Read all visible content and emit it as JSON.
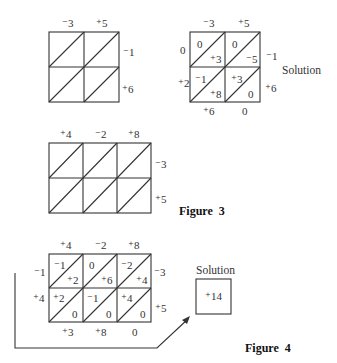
{
  "figure_top_left": {
    "columns": [
      "⁻3",
      "⁺5"
    ],
    "rows": [
      "⁻1",
      "⁺6"
    ]
  },
  "figure_top_right": {
    "columns": [
      "⁻3",
      "⁺5"
    ],
    "rows": [
      "⁻1",
      "⁺6"
    ],
    "cells": [
      [
        {
          "upper": "0",
          "lower": "⁺3"
        },
        {
          "upper": "0",
          "lower": "⁻5"
        }
      ],
      [
        {
          "upper": "⁻1",
          "lower": "⁺8"
        },
        {
          "upper": "⁺3",
          "lower": "0"
        }
      ]
    ],
    "left_sums": [
      "0",
      "⁺2"
    ],
    "bottom_sums": [
      "⁺6",
      "0"
    ],
    "label": "Solution"
  },
  "figure3": {
    "columns": [
      "⁺4",
      "⁻2",
      "⁺8"
    ],
    "rows": [
      "⁻3",
      "⁺5"
    ],
    "caption": "Figure  3"
  },
  "figure4": {
    "columns": [
      "⁺4",
      "⁻2",
      "⁺8"
    ],
    "rows": [
      "⁻3",
      "⁺5"
    ],
    "cells": [
      [
        {
          "upper": "⁻1",
          "lower": "⁺2"
        },
        {
          "upper": "0",
          "lower": "⁺6"
        },
        {
          "upper": "⁻2",
          "lower": "⁺4"
        }
      ],
      [
        {
          "upper": "⁺2",
          "lower": "0"
        },
        {
          "upper": "⁻1",
          "lower": "0"
        },
        {
          "upper": "⁺4",
          "lower": "0"
        }
      ]
    ],
    "left_sums": [
      "⁻1",
      "⁺4"
    ],
    "bottom_sums": [
      "⁺3",
      "⁺8",
      "0"
    ],
    "solution_label": "Solution",
    "solution_value": "⁺14",
    "caption": "Figure  4"
  }
}
